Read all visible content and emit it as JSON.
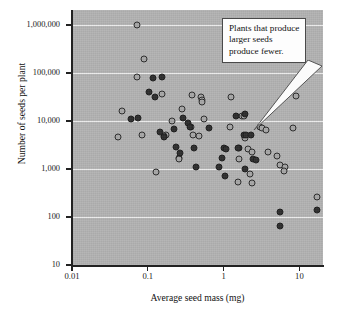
{
  "chart": {
    "type": "scatter",
    "xlabel": "Average seed mass (mg)",
    "ylabel": "Number of seeds per plant"
  },
  "annotation": {
    "text": "Plants that produce larger seeds produce fewer."
  },
  "axes": {
    "y_ticks": [
      "1,000,000",
      "100,000",
      "10,000",
      "1,000",
      "100",
      "10"
    ],
    "x_ticks": [
      "0.01",
      "0.1",
      "1",
      "10"
    ]
  },
  "chart_data": {
    "type": "scatter",
    "title": "",
    "xlabel": "Average seed mass (mg)",
    "ylabel": "Number of seeds per plant",
    "xscale": "log",
    "yscale": "log",
    "xlim": [
      0.01,
      33
    ],
    "ylim": [
      10,
      2200000
    ],
    "xticks": [
      0.01,
      0.1,
      1,
      10
    ],
    "yticks": [
      10,
      100,
      1000,
      10000,
      100000,
      1000000
    ],
    "grid": "horizontal",
    "legend": "none",
    "series": [
      {
        "name": "open-marker",
        "marker": "open-circle",
        "points": [
          [
            0.073,
            1000000
          ],
          [
            0.09,
            200000
          ],
          [
            0.073,
            82000
          ],
          [
            0.155,
            36000
          ],
          [
            0.046,
            16000
          ],
          [
            0.04,
            4600
          ],
          [
            0.085,
            5200
          ],
          [
            0.21,
            9800
          ],
          [
            0.175,
            5000
          ],
          [
            0.165,
            4900
          ],
          [
            0.28,
            18000
          ],
          [
            0.255,
            1700
          ],
          [
            0.255,
            1600
          ],
          [
            0.38,
            34000
          ],
          [
            0.37,
            7400
          ],
          [
            0.4,
            5200
          ],
          [
            0.505,
            32000
          ],
          [
            0.52,
            27000
          ],
          [
            0.515,
            25000
          ],
          [
            0.47,
            4800
          ],
          [
            0.55,
            11000
          ],
          [
            0.13,
            860
          ],
          [
            1.25,
            32000
          ],
          [
            1.2,
            7400
          ],
          [
            1.75,
            13000
          ],
          [
            1.85,
            12500
          ],
          [
            1.6,
            1600
          ],
          [
            1.9,
            4500
          ],
          [
            2.1,
            2600
          ],
          [
            2.4,
            2300
          ],
          [
            2.2,
            770
          ],
          [
            2.35,
            500
          ],
          [
            1.55,
            540
          ],
          [
            3.0,
            7400
          ],
          [
            3.2,
            7100
          ],
          [
            3.6,
            6600
          ],
          [
            3.9,
            2300
          ],
          [
            5.1,
            1900
          ],
          [
            5.6,
            1200
          ],
          [
            6.4,
            1100
          ],
          [
            6.3,
            900
          ],
          [
            9.0,
            33000
          ],
          [
            8.2,
            7300
          ],
          [
            17.0,
            260
          ]
        ]
      },
      {
        "name": "filled-marker",
        "marker": "filled-circle",
        "points": [
          [
            0.118,
            78000
          ],
          [
            0.155,
            82000
          ],
          [
            0.105,
            40000
          ],
          [
            0.125,
            31000
          ],
          [
            0.06,
            10800
          ],
          [
            0.075,
            11600
          ],
          [
            0.145,
            5900
          ],
          [
            0.165,
            4700
          ],
          [
            0.225,
            6700
          ],
          [
            0.235,
            2900
          ],
          [
            0.27,
            2200
          ],
          [
            0.29,
            11500
          ],
          [
            0.335,
            9200
          ],
          [
            0.355,
            7500
          ],
          [
            0.41,
            2700
          ],
          [
            0.43,
            1080
          ],
          [
            0.65,
            7300
          ],
          [
            0.88,
            1120
          ],
          [
            0.95,
            1700
          ],
          [
            1.0,
            2800
          ],
          [
            1.08,
            2600
          ],
          [
            1.05,
            700
          ],
          [
            1.45,
            13000
          ],
          [
            1.6,
            2800
          ],
          [
            1.55,
            2700
          ],
          [
            1.9,
            13800
          ],
          [
            1.85,
            5100
          ],
          [
            1.95,
            5000
          ],
          [
            1.9,
            1000
          ],
          [
            2.3,
            5000
          ],
          [
            2.45,
            1600
          ],
          [
            2.7,
            1550
          ],
          [
            5.6,
            128
          ],
          [
            5.6,
            64
          ],
          [
            17.0,
            142
          ]
        ]
      }
    ]
  }
}
